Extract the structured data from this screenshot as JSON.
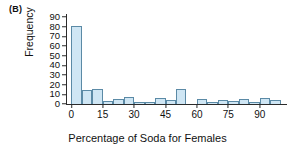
{
  "figure": {
    "panel_label": "(B)"
  },
  "chart_data": {
    "type": "bar",
    "title": "",
    "xlabel": "Percentage of Soda for Females",
    "ylabel": "Frequency",
    "xlim": [
      -2.5,
      102.5
    ],
    "ylim": [
      0,
      93
    ],
    "grid": false,
    "legend": null,
    "bin_width": 5,
    "bar_color": "#cfe6f4",
    "bar_edge_color": "#5b8aa6",
    "xticks": [
      0,
      15,
      30,
      45,
      60,
      75,
      90
    ],
    "yticks": [
      0,
      10,
      20,
      30,
      40,
      50,
      60,
      70,
      80,
      90
    ],
    "bin_starts": [
      0,
      5,
      10,
      15,
      20,
      25,
      30,
      35,
      40,
      45,
      50,
      55,
      60,
      65,
      70,
      75,
      80,
      85,
      90,
      95
    ],
    "categories": [
      "0-5",
      "5-10",
      "10-15",
      "15-20",
      "20-25",
      "25-30",
      "30-35",
      "35-40",
      "40-45",
      "45-50",
      "50-55",
      "55-60",
      "60-65",
      "65-70",
      "70-75",
      "75-80",
      "80-85",
      "85-90",
      "90-95",
      "95-100"
    ],
    "values": [
      81,
      14,
      16,
      3,
      5,
      7,
      2,
      2,
      6,
      4,
      15,
      0,
      5,
      2,
      4,
      3,
      5,
      2,
      6,
      4
    ]
  }
}
